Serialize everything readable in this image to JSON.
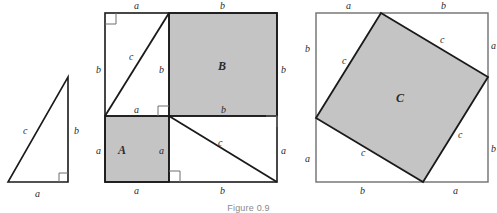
{
  "figure": {
    "caption": "Figure 0.9",
    "colors": {
      "stroke": "#1a1a1a",
      "shade": "#c4c4c4",
      "background": "#ffffff",
      "label": "#2b2b2b",
      "caption": "#8a8a8a"
    },
    "panels": [
      {
        "name": "triangle-panel",
        "labels": {
          "hypotenuse": "c",
          "vertical": "b",
          "horizontal": "a"
        }
      },
      {
        "name": "dissection-panel",
        "region_labels": {
          "square_a": "A",
          "square_b": "B"
        },
        "edge_labels": {
          "top_left": "a",
          "top_right": "b",
          "left_upper": "b",
          "left_lower": "a",
          "right_upper": "b",
          "right_lower": "a",
          "bottom_left": "a",
          "bottom_right": "b",
          "mid_left": "a",
          "mid_right": "b",
          "inner_vertical_upper": "b",
          "inner_vertical_lower": "a",
          "diagonal_upper": "c",
          "diagonal_lower": "c"
        }
      },
      {
        "name": "tilted-square-panel",
        "region_labels": {
          "square_c": "C"
        },
        "edge_labels": {
          "top_left": "a",
          "top_right": "b",
          "left_upper": "b",
          "left_lower": "a",
          "right_upper": "a",
          "right_lower": "b",
          "bottom_left": "b",
          "bottom_right": "a",
          "tilt_upper_left": "c",
          "tilt_upper_right": "c",
          "tilt_lower_left": "c",
          "tilt_lower_right": "c"
        }
      }
    ]
  }
}
